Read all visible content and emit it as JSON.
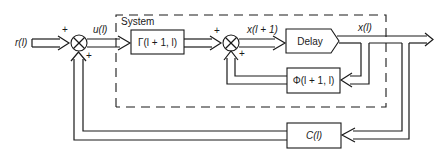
{
  "diagram": {
    "system_label": "System",
    "input_label": "r(l)",
    "control_label": "u(l)",
    "next_state_label": "x(l + 1)",
    "state_label": "x(l)",
    "blocks": {
      "gamma": "Γ(l + 1, l)",
      "delay": "Delay",
      "phi": "Φ(l + 1, l)",
      "c": "C(l)"
    },
    "signs": {
      "sum1_top": "+",
      "sum1_bottom": "+",
      "sum2_top": "+",
      "sum2_bottom": "+"
    }
  }
}
